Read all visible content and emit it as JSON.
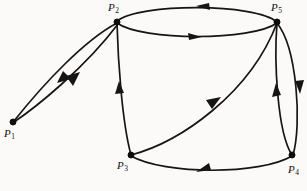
{
  "figure": {
    "kind": "directed-graph",
    "width": 307,
    "height": 191,
    "background_color": "#fbfaf8",
    "ink_color": "#151515"
  },
  "nodes": [
    {
      "id": "P1",
      "label_base": "P",
      "label_sub": "1",
      "x": 13,
      "y": 122,
      "label_x": 4,
      "label_y": 128
    },
    {
      "id": "P2",
      "label_base": "P",
      "label_sub": "2",
      "x": 117,
      "y": 22,
      "label_x": 108,
      "label_y": 2
    },
    {
      "id": "P3",
      "label_base": "P",
      "label_sub": "3",
      "x": 131,
      "y": 155,
      "label_x": 117,
      "label_y": 160
    },
    {
      "id": "P4",
      "label_base": "P",
      "label_sub": "4",
      "x": 292,
      "y": 155,
      "label_x": 288,
      "label_y": 164
    },
    {
      "id": "P5",
      "label_base": "P",
      "label_sub": "5",
      "x": 277,
      "y": 22,
      "label_x": 271,
      "label_y": 2
    }
  ],
  "edges": [
    {
      "id": "e-p2-p1-upper",
      "from": "P2",
      "to": "P1",
      "shape": "curve-upper-left-lens",
      "arrow_direction": "down-left"
    },
    {
      "id": "e-p1-p2-lower",
      "from": "P1",
      "to": "P2",
      "shape": "curve-lower-left-lens",
      "arrow_direction": "up-right"
    },
    {
      "id": "e-p5-p2-top",
      "from": "P5",
      "to": "P2",
      "shape": "arc-top-outer",
      "arrow_direction": "left"
    },
    {
      "id": "e-p2-p5-inner",
      "from": "P2",
      "to": "P5",
      "shape": "arc-top-inner",
      "arrow_direction": "right"
    },
    {
      "id": "e-p3-p2",
      "from": "P3",
      "to": "P2",
      "shape": "arc-left-side",
      "arrow_direction": "up"
    },
    {
      "id": "e-p3-p5",
      "from": "P3",
      "to": "P5",
      "shape": "arc-diagonal",
      "arrow_direction": "up-right"
    },
    {
      "id": "e-p4-p5-inner",
      "from": "P4",
      "to": "P5",
      "shape": "arc-right-inner",
      "arrow_direction": "up"
    },
    {
      "id": "e-p5-p4-outer",
      "from": "P5",
      "to": "P4",
      "shape": "arc-right-outer",
      "arrow_direction": "down"
    },
    {
      "id": "e-p4-p3",
      "from": "P4",
      "to": "P3",
      "shape": "arc-bottom",
      "arrow_direction": "left"
    }
  ]
}
